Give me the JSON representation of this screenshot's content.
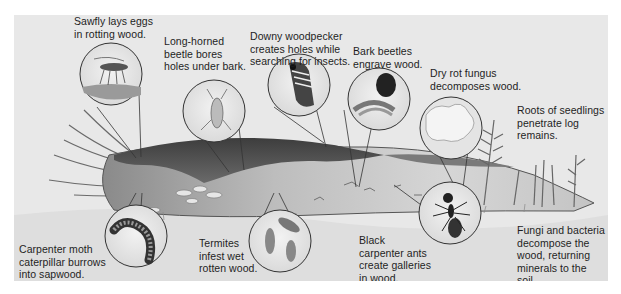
{
  "figure": {
    "background_color": "#e8e8e8",
    "ink_color": "#1e1e1e",
    "log_dark_color": "#4a4a4a",
    "log_light_color": "#cfcfcf"
  },
  "labels": [
    {
      "id": "sawfly",
      "text": "Sawfly lays eggs\nin rotting wood.",
      "icon": "sawfly-icon"
    },
    {
      "id": "longhorned",
      "text": "Long-horned\nbeetle bores\nholes under bark.",
      "icon": "long-horned-beetle-icon"
    },
    {
      "id": "woodpecker",
      "text": "Downy woodpecker\ncreates holes while\nsearching for insects.",
      "icon": "woodpecker-icon"
    },
    {
      "id": "barkbeetle",
      "text": "Bark beetles\nengrave wood.",
      "icon": "bark-beetle-icon"
    },
    {
      "id": "dryrot",
      "text": "Dry rot fungus\ndecomposes wood.",
      "icon": "dry-rot-fungus-icon"
    },
    {
      "id": "roots",
      "text": "Roots of seedlings\npenetrate log\nremains.",
      "icon": "seedling-icon"
    },
    {
      "id": "moth",
      "text": "Carpenter moth\ncaterpillar burrows\ninto sapwood.",
      "icon": "caterpillar-icon"
    },
    {
      "id": "termites",
      "text": "Termites\ninfest wet\nrotten wood.",
      "icon": "termite-icon"
    },
    {
      "id": "ants",
      "text": "Black\ncarpenter ants\ncreate galleries\nin wood.",
      "icon": "ant-icon"
    },
    {
      "id": "fungi",
      "text": "Fungi and bacteria\ndecompose the\nwood, returning\nminerals to the soil.",
      "icon": "fungi-bacteria-icon"
    }
  ]
}
